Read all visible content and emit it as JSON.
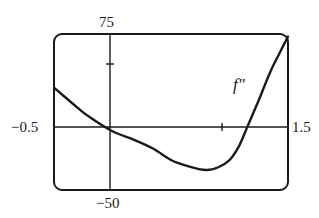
{
  "chart_data": {
    "type": "line",
    "title": "",
    "xlabel": "",
    "ylabel": "",
    "xlim": [
      -0.5,
      1.5
    ],
    "ylim": [
      -50,
      75
    ],
    "grid": false,
    "x_ticks": [
      1
    ],
    "y_ticks": [
      50
    ],
    "window_labels": {
      "xmin": "-0.5",
      "xmax": "1.5",
      "ymin": "-50",
      "ymax": "75"
    },
    "series": [
      {
        "name": "f″",
        "x": [
          -0.5,
          -0.3,
          -0.19,
          0,
          0.19,
          0.35,
          0.5,
          0.65,
          0.8,
          0.9,
          1.0,
          1.08,
          1.15,
          1.25,
          1.35,
          1.43,
          1.5
        ],
        "values": [
          32,
          16,
          8,
          -3,
          -10,
          -17,
          -26,
          -31,
          -34,
          -32,
          -26,
          -15,
          0,
          22,
          45,
          60,
          73
        ]
      }
    ],
    "annotations": [
      {
        "text": "f″",
        "x": 1.25,
        "y": 30
      }
    ]
  },
  "labels": {
    "ymax": "75",
    "ymin": "−50",
    "xmin": "−0.5",
    "xmax": "1.5",
    "curve": "f″"
  }
}
